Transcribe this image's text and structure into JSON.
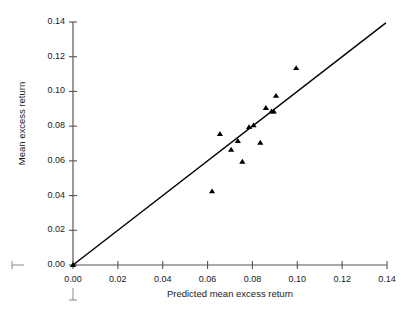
{
  "chart_data": {
    "type": "scatter",
    "title": "",
    "xlabel": "Predicted mean excess return",
    "ylabel": "Mean excess return",
    "xlim": [
      0.0,
      0.14
    ],
    "ylim": [
      0.0,
      0.14
    ],
    "xticks": [
      "0.00",
      "0.02",
      "0.04",
      "0.06",
      "0.08",
      "0.10",
      "0.12",
      "0.14"
    ],
    "yticks": [
      "0.00",
      "0.02",
      "0.04",
      "0.06",
      "0.08",
      "0.10",
      "0.12",
      "0.14"
    ],
    "xtick_values": [
      0.0,
      0.02,
      0.04,
      0.06,
      0.08,
      0.1,
      0.12,
      0.14
    ],
    "ytick_values": [
      0.0,
      0.02,
      0.04,
      0.06,
      0.08,
      0.1,
      0.12,
      0.14
    ],
    "grid": false,
    "legend": "none",
    "marker": "triangle-up",
    "marker_color": "#000000",
    "points": [
      {
        "x": 0.0,
        "y": 0.0
      },
      {
        "x": 0.062,
        "y": 0.0425
      },
      {
        "x": 0.0655,
        "y": 0.0755
      },
      {
        "x": 0.0705,
        "y": 0.0665
      },
      {
        "x": 0.0735,
        "y": 0.0715
      },
      {
        "x": 0.0755,
        "y": 0.0595
      },
      {
        "x": 0.0785,
        "y": 0.0795
      },
      {
        "x": 0.0805,
        "y": 0.0805
      },
      {
        "x": 0.0835,
        "y": 0.0705
      },
      {
        "x": 0.086,
        "y": 0.0905
      },
      {
        "x": 0.0885,
        "y": 0.0885
      },
      {
        "x": 0.0895,
        "y": 0.0885
      },
      {
        "x": 0.0905,
        "y": 0.0975
      },
      {
        "x": 0.0995,
        "y": 0.1135
      }
    ],
    "reference_line": {
      "kind": "identity",
      "from": {
        "x": 0.0,
        "y": 0.0
      },
      "to": {
        "x": 0.1395,
        "y": 0.1395
      },
      "color": "#000000"
    },
    "artifacts": [
      {
        "name": "scan-mark-left",
        "shape": "horizontal-tick"
      },
      {
        "name": "scan-mark-below",
        "shape": "vertical-tick"
      }
    ]
  }
}
